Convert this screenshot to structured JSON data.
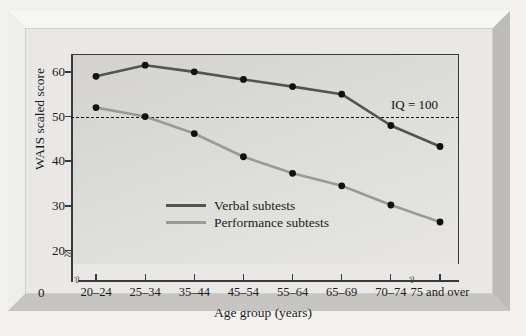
{
  "chart_data": {
    "type": "line",
    "title": "",
    "xlabel": "Age group (years)",
    "ylabel": "WAIS scaled score",
    "categories": [
      "20–24",
      "25–34",
      "35–44",
      "45–54",
      "55–64",
      "65–69",
      "70–74",
      "75 and over"
    ],
    "series": [
      {
        "name": "Verbal subtests",
        "color": "#545454",
        "values": [
          59.0,
          61.5,
          60.0,
          58.3,
          56.7,
          55.0,
          48.0,
          43.3
        ]
      },
      {
        "name": "Performance subtests",
        "color": "#9a9a9a",
        "values": [
          52.0,
          50.0,
          46.2,
          41.0,
          37.3,
          34.5,
          30.2,
          26.4
        ]
      }
    ],
    "ylim": [
      17,
      64
    ],
    "yticks": [
      20,
      30,
      40,
      50,
      60
    ],
    "ytick_labels": [
      "20",
      "30",
      "40",
      "50",
      "60"
    ],
    "y_origin_label": "0",
    "y_axis_break": true,
    "x_axis_break_after_index": 6,
    "grid": false,
    "legend_position": "inside-center-left",
    "annotations": [
      {
        "text": "IQ = 100",
        "value": 50,
        "style": "dashed-reference-line"
      }
    ]
  },
  "colors": {
    "verbal": "#545454",
    "performance": "#9a9a9a",
    "axis": "#3a3a3a",
    "plot_background": "#dededb",
    "frame": "#d8d7d4",
    "text": "#1b1b1b"
  }
}
